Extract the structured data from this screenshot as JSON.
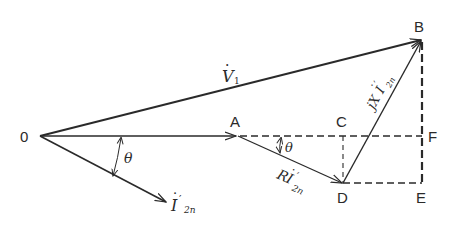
{
  "diagram": {
    "type": "phasor-diagram",
    "colors": {
      "line": "#2a2a2a",
      "background": "#ffffff"
    },
    "points": {
      "O": {
        "label": "0"
      },
      "A": {
        "label": "A"
      },
      "B": {
        "label": "B"
      },
      "C": {
        "label": "C"
      },
      "D": {
        "label": "D"
      },
      "E": {
        "label": "E"
      },
      "F": {
        "label": "F"
      }
    },
    "vectors": {
      "V1": {
        "main": "V",
        "sub": "1",
        "dot": "·"
      },
      "I2n": {
        "main": "I",
        "prime": "′",
        "sub": "2n",
        "dot": "·"
      },
      "RI": {
        "prefix": "R",
        "main": "I",
        "prime": "′",
        "sub": "2n",
        "dot": "·"
      },
      "jXI": {
        "prefix": "jX",
        "main": "I",
        "prime": "′",
        "sub": "2n",
        "dot": "·"
      }
    },
    "angles": {
      "theta_origin": "θ",
      "theta_A": "θ"
    }
  }
}
